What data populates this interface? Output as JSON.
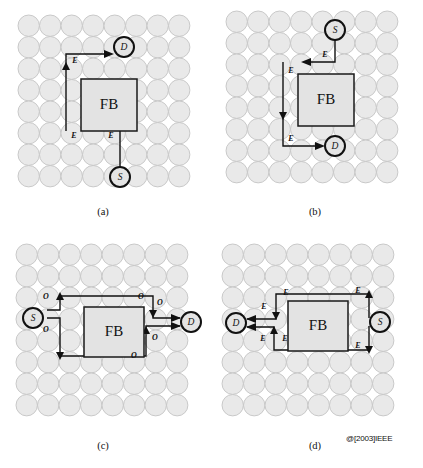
{
  "figure": {
    "copyright": "@[2003]IEEE",
    "panels": [
      {
        "id": "a",
        "caption": "(a)",
        "obstacle_label": "FB",
        "source_label": "S",
        "destination_label": "D",
        "edge_labels": [
          "E",
          "E",
          "E"
        ],
        "grid_rows": 8,
        "grid_cols": 8
      },
      {
        "id": "b",
        "caption": "(b)",
        "obstacle_label": "FB",
        "source_label": "S",
        "destination_label": "D",
        "edge_labels": [
          "E",
          "E",
          "E"
        ],
        "grid_rows": 8,
        "grid_cols": 8
      },
      {
        "id": "c",
        "caption": "(c)",
        "obstacle_label": "FB",
        "source_label": "S",
        "destination_label": "D",
        "edge_labels": [
          "O",
          "O",
          "O",
          "O",
          "O",
          "O"
        ],
        "grid_rows": 8,
        "grid_cols": 8
      },
      {
        "id": "d",
        "caption": "(d)",
        "obstacle_label": "FB",
        "source_label": "S",
        "destination_label": "D",
        "edge_labels": [
          "E",
          "E",
          "E",
          "E",
          "E",
          "E",
          "E"
        ],
        "grid_rows": 8,
        "grid_cols": 8
      }
    ]
  },
  "colors": {
    "node_circle_fill": "#e4e4e4",
    "grid_circle_fill": "#e9e9e9",
    "grid_circle_stroke": "#c4c4c4",
    "obstacle_fill": "#e3e3e3",
    "route_stroke": "#111111",
    "background": "#ffffff"
  }
}
